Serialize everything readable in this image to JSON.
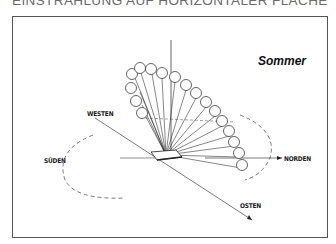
{
  "title": "EINSTRAHLUNG AUF HORIZONTALER FLÄCHE",
  "season_label": "Sommer",
  "directions": {
    "west": "WESTEN",
    "south": "SÜDEN",
    "north": "NORDEN",
    "east": "OSTEN"
  },
  "diagram": {
    "type": "sun-path-irradiation",
    "sun_positions": 17,
    "colors": {
      "line": "#222222",
      "frame": "#555555",
      "title": "#6a6a6a"
    }
  }
}
